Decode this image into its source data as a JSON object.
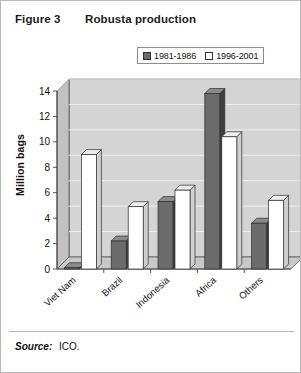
{
  "figure": {
    "label": "Figure 3",
    "title": "Robusta production"
  },
  "footer": {
    "source_label": "Source:",
    "source_value": "ICO."
  },
  "colors": {
    "series_dark": "#6b6b6b",
    "series_dark_side": "#3f3f3f",
    "series_light": "#ffffff",
    "series_light_side": "#cfcfcf",
    "plot_background": "#d4d4d4",
    "plot_wall_side": "#c2c2c2",
    "gridline": "#efefef",
    "axis_line": "#555555",
    "border": "#b9b9b9",
    "text": "#111111"
  },
  "chart_data": {
    "type": "bar",
    "title": "Robusta production",
    "xlabel": "",
    "ylabel": "Million bags",
    "ylim": [
      0,
      14
    ],
    "yticks": [
      0,
      2,
      4,
      6,
      8,
      10,
      12,
      14
    ],
    "ytick_labels": [
      "0",
      "2",
      "4",
      "6",
      "8",
      "10",
      "12",
      "14"
    ],
    "grid": true,
    "legend_position": "top-right",
    "categories": [
      "Viet Nam",
      "Brazil",
      "Indonesia",
      "Africa",
      "Others"
    ],
    "series": [
      {
        "name": "1981-1986",
        "color": "#6b6b6b",
        "values": [
          0.1,
          2.2,
          5.3,
          13.8,
          3.6
        ]
      },
      {
        "name": "1996-2001",
        "color": "#ffffff",
        "values": [
          9.0,
          4.9,
          6.2,
          10.4,
          5.4
        ]
      }
    ]
  }
}
